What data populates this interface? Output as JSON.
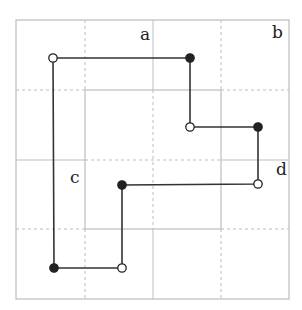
{
  "diagram": {
    "type": "grid-path",
    "grid": {
      "cols": 4,
      "rows": 4,
      "outer_box": [
        16,
        20,
        289,
        299
      ],
      "inner_box": [
        85,
        90,
        221,
        229
      ],
      "x_lines": [
        85,
        153,
        221
      ],
      "y_lines": [
        90,
        160,
        229
      ]
    },
    "labels": [
      {
        "text": "a",
        "x": 140,
        "y": 40
      },
      {
        "text": "b",
        "x": 272,
        "y": 38
      },
      {
        "text": "c",
        "x": 70,
        "y": 183
      },
      {
        "text": "d",
        "x": 276,
        "y": 175
      }
    ],
    "path": [
      {
        "x": 53,
        "y": 58,
        "fill": "open"
      },
      {
        "x": 190,
        "y": 58,
        "fill": "filled"
      },
      {
        "x": 190,
        "y": 127,
        "fill": "open"
      },
      {
        "x": 258,
        "y": 127,
        "fill": "filled"
      },
      {
        "x": 258,
        "y": 184,
        "fill": "open"
      },
      {
        "x": 122,
        "y": 185,
        "fill": "filled"
      },
      {
        "x": 122,
        "y": 268,
        "fill": "open"
      },
      {
        "x": 54,
        "y": 268,
        "fill": "filled"
      }
    ],
    "colors": {
      "grid": "#bdbdbd",
      "path": "#333333",
      "dot": "#222222"
    }
  }
}
